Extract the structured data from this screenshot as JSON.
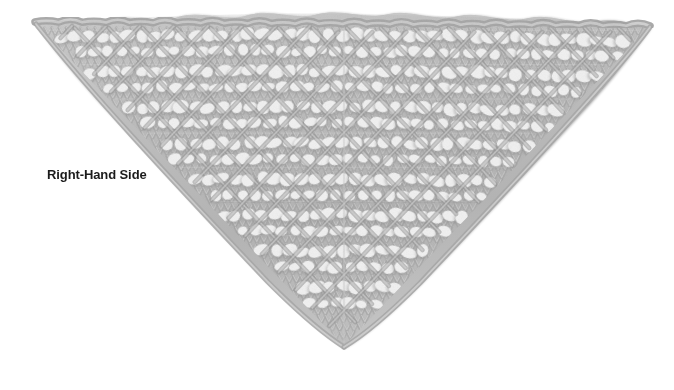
{
  "page": {
    "background_color": "#ffffff",
    "width": 674,
    "height": 390
  },
  "caption": {
    "text": "Right-Hand Side",
    "color": "#1b1b1b",
    "weight": "bold",
    "position": {
      "x": 47,
      "y": 167
    }
  },
  "figure": {
    "name": "knitted-lace-shawl",
    "shape": "triangle",
    "orientation": "point-down",
    "colors": {
      "yarn_light": "#e8e8e8",
      "yarn_mid": "#b9b9b9",
      "yarn_dark": "#8c8c8c",
      "yarn_shadow": "#6e6e6e",
      "eyelet_hole": "#ffffff",
      "background": "#ffffff"
    },
    "geometry": {
      "top_left": {
        "x": 35,
        "y": 22
      },
      "top_right": {
        "x": 650,
        "y": 26
      },
      "bottom_point": {
        "x": 344,
        "y": 346
      },
      "top_edge_style": "scalloped-cast-on",
      "rows": 9,
      "eyelet_band_count": 8
    },
    "texture": {
      "stitch": "stockinette with yarn-over eyelets",
      "motif": "diagonal chevron lace with diamond eyelets",
      "eyelet_width_px": 14,
      "eyelet_height_px": 11
    }
  }
}
